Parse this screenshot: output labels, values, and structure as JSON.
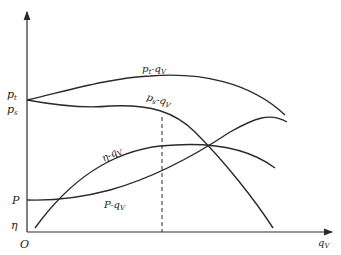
{
  "diagram": {
    "type": "fan performance curves",
    "axes": {
      "origin_label": "O",
      "x_label": "q",
      "x_label_sub": "V",
      "y_labels": [
        {
          "id": "pt",
          "main": "p",
          "sub": "t"
        },
        {
          "id": "ps",
          "main": "p",
          "sub": "s"
        },
        {
          "id": "P",
          "main": "P",
          "sub": ""
        },
        {
          "id": "eta",
          "main": "η",
          "sub": ""
        }
      ]
    },
    "curves": [
      {
        "id": "pt-qv",
        "main": "p",
        "sub1": "t",
        "dash": "-q",
        "sub2": "V"
      },
      {
        "id": "ps-qv",
        "main": "p",
        "sub1": "s",
        "dash": "-q",
        "sub2": "V"
      },
      {
        "id": "eta-qv",
        "main": "η",
        "sub1": "",
        "dash": "-q",
        "sub2": "V"
      },
      {
        "id": "P-qv",
        "main": "P",
        "sub1": "",
        "dash": "-q",
        "sub2": "V"
      }
    ],
    "colors": {
      "line": "#2a2a2a",
      "text": "#222222",
      "background": "#ffffff"
    }
  }
}
